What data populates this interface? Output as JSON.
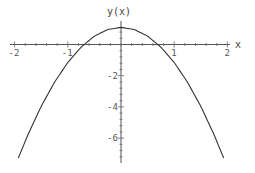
{
  "chart_data": {
    "type": "line",
    "title": "",
    "xlabel": "x",
    "ylabel": "y(x)",
    "xlim": [
      -2.05,
      2.05
    ],
    "ylim": [
      -7.4,
      1.3
    ],
    "grid": false,
    "legend": null,
    "x_ticks": [
      -2,
      -1,
      1,
      2
    ],
    "x_tick_labels": [
      "-2",
      "-1",
      "1",
      "2"
    ],
    "y_ticks": [
      -2,
      -4,
      -6
    ],
    "y_tick_labels": [
      "-2",
      "-4",
      "-6"
    ],
    "series": [
      {
        "name": "y(x)",
        "color": "#333333",
        "x": [
          -1.93,
          -1.75,
          -1.5,
          -1.25,
          -1.0,
          -0.75,
          -0.5,
          -0.25,
          0.0,
          0.25,
          0.5,
          0.75,
          1.0,
          1.25,
          1.5,
          1.75,
          1.93
        ],
        "y": [
          -7.28,
          -5.79,
          -3.96,
          -2.42,
          -1.15,
          -0.17,
          0.54,
          0.96,
          1.1,
          0.96,
          0.54,
          -0.17,
          -1.15,
          -2.42,
          -3.96,
          -5.79,
          -7.28
        ]
      }
    ]
  },
  "axes": {
    "x_label": "x",
    "y_label": "y(x)"
  }
}
